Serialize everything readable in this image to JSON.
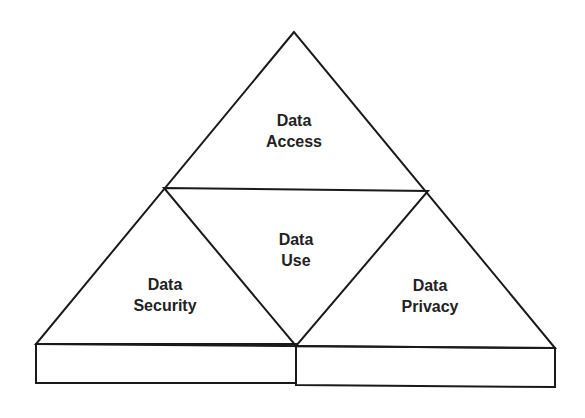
{
  "diagram": {
    "type": "triangle-of-triangles",
    "sections": {
      "top": {
        "line1": "Data",
        "line2": "Access"
      },
      "center": {
        "line1": "Data",
        "line2": "Use"
      },
      "left": {
        "line1": "Data",
        "line2": "Security"
      },
      "right": {
        "line1": "Data",
        "line2": "Privacy"
      }
    },
    "base": {
      "left_block": "",
      "right_block": ""
    },
    "colors": {
      "stroke": "#1a1a1a",
      "text": "#222222",
      "background": "#ffffff"
    }
  }
}
